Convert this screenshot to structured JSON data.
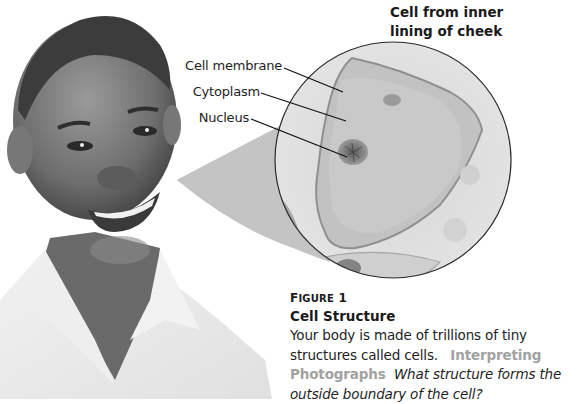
{
  "figure": {
    "magnified_view": {
      "title_line1": "Cell from inner",
      "title_line2": "lining of cheek",
      "labels": [
        {
          "text": "Cell membrane"
        },
        {
          "text": "Cytoplasm"
        },
        {
          "text": "Nucleus"
        }
      ]
    },
    "photo": {
      "subject": "smiling boy in white collared shirt",
      "style": "grayscale"
    },
    "caption": {
      "figure_label_prefix": "F",
      "figure_label_rest": "IGURE",
      "figure_number": "1",
      "title": "Cell Structure",
      "body": "Your body is made of trillions of tiny structures called cells.",
      "skill_label": "Interpreting Photographs",
      "question": "What structure forms the outside boundary of the cell?"
    }
  },
  "colors": {
    "text": "#1a1a1a",
    "skill_label": "#a2a2a2",
    "wedge": "#c4c4c4",
    "circle_outline": "#2a2a2a"
  }
}
